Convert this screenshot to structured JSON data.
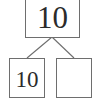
{
  "diagram": {
    "type": "number-bond",
    "canvas": {
      "width": 99,
      "height": 107,
      "background": "#ffffff"
    },
    "style": {
      "box_border_color": "#6e6e6e",
      "box_fill_color": "#ffffff",
      "connector_color": "#6e6e6e",
      "text_color": "#2b2b2b"
    },
    "whole": {
      "role": "whole",
      "value": "10",
      "filled": true
    },
    "parts": [
      {
        "role": "part-left",
        "value": "10",
        "filled": true
      },
      {
        "role": "part-right",
        "value": "",
        "filled": false
      }
    ],
    "connectors": [
      {
        "from": "whole",
        "to": "part-left"
      },
      {
        "from": "whole",
        "to": "part-right"
      }
    ]
  }
}
